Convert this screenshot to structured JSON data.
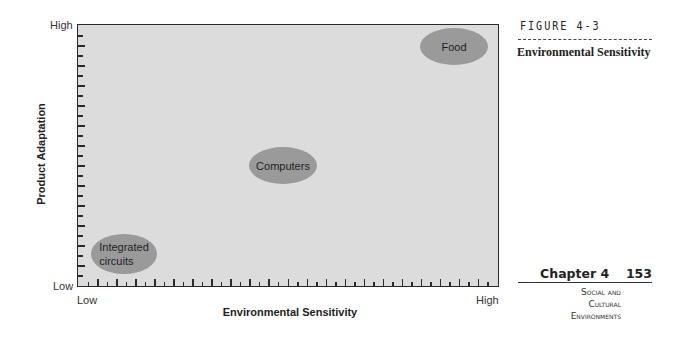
{
  "figure": {
    "label": "FIGURE 4-3",
    "title": "Environmental Sensitivity"
  },
  "page": {
    "chapter": "Chapter 4",
    "number": "153",
    "section_lines": [
      "Social and",
      "Cultural",
      "Environments"
    ]
  },
  "chart_data": {
    "type": "scatter",
    "title": "Environmental Sensitivity",
    "xlabel": "Environmental Sensitivity",
    "ylabel": "Product Adaptation",
    "x_tick_labels": [
      "Low",
      "High"
    ],
    "y_tick_labels": [
      "Low",
      "High"
    ],
    "xlim": [
      0,
      1
    ],
    "ylim": [
      0,
      1
    ],
    "grid": false,
    "points": [
      {
        "label": "Integrated circuits",
        "x": 0.11,
        "y": 0.11
      },
      {
        "label": "Computers",
        "x": 0.49,
        "y": 0.46
      },
      {
        "label": "Food",
        "x": 0.89,
        "y": 0.91
      }
    ]
  },
  "axes": {
    "y_high": "High",
    "y_low": "Low",
    "x_low": "Low",
    "x_high": "High",
    "x_title": "Environmental Sensitivity",
    "y_title": "Product Adaptation"
  },
  "blobs": [
    {
      "line1": "Integrated",
      "line2": "circuits"
    },
    {
      "line1": "Computers"
    },
    {
      "line1": "Food"
    }
  ]
}
